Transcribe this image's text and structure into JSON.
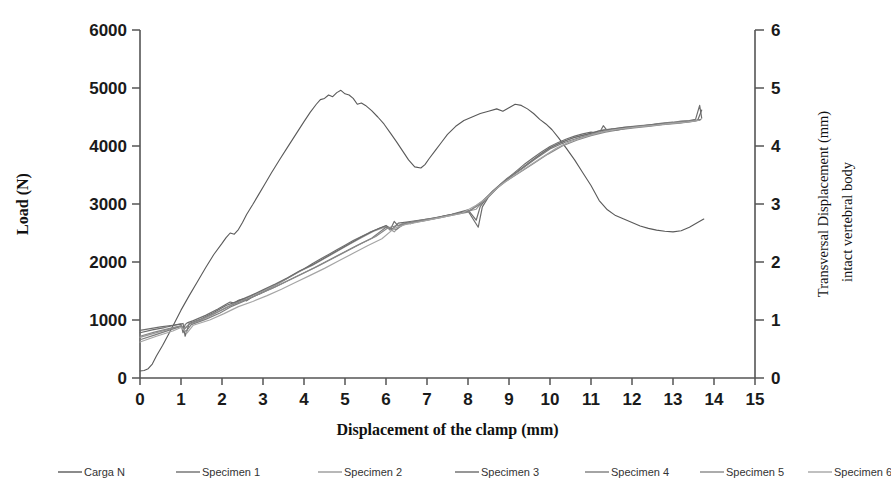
{
  "chart_data": {
    "type": "line",
    "title": "",
    "xlabel": "Displacement of the clamp (mm)",
    "ylabel": "Load (N)",
    "ylabel_right_line1": "Transversal Displacement (mm)",
    "ylabel_right_line2": "intact vertebral body",
    "xlim": [
      0,
      15
    ],
    "ylim": [
      0,
      6000
    ],
    "ylim_right": [
      0,
      6
    ],
    "xticks": [
      "0",
      "1",
      "2",
      "3",
      "4",
      "5",
      "6",
      "7",
      "8",
      "9",
      "10",
      "11",
      "12",
      "13",
      "14",
      "15"
    ],
    "yticks": [
      "0",
      "1000",
      "2000",
      "3000",
      "4000",
      "5000",
      "6000"
    ],
    "yticks_right": [
      "0",
      "1",
      "2",
      "3",
      "4",
      "5",
      "6"
    ],
    "grid": false,
    "legend_position": "bottom",
    "legend": [
      {
        "name": "Carga N",
        "color": "#595959",
        "axis": "left"
      },
      {
        "name": "Specimen 1",
        "color": "#6e6e6e",
        "axis": "right"
      },
      {
        "name": "Specimen 2",
        "color": "#9a9a9a",
        "axis": "right"
      },
      {
        "name": "Specimen 3",
        "color": "#6b6b6b",
        "axis": "right"
      },
      {
        "name": "Specimen 4",
        "color": "#7d7d7d",
        "axis": "right"
      },
      {
        "name": "Specimen 5",
        "color": "#888888",
        "axis": "right"
      },
      {
        "name": "Specimen 6",
        "color": "#a5a5a5",
        "axis": "right"
      }
    ],
    "series": [
      {
        "name": "Carga N",
        "axis": "left",
        "color": "#595959",
        "x": [
          0.0,
          0.1,
          0.2,
          0.3,
          0.4,
          0.55,
          0.7,
          0.85,
          1.0,
          1.2,
          1.4,
          1.6,
          1.8,
          2.0,
          2.1,
          2.2,
          2.3,
          2.4,
          2.5,
          2.6,
          2.75,
          2.9,
          3.05,
          3.2,
          3.4,
          3.6,
          3.8,
          4.0,
          4.15,
          4.3,
          4.4,
          4.5,
          4.6,
          4.7,
          4.8,
          4.9,
          5.0,
          5.1,
          5.2,
          5.3,
          5.4,
          5.5,
          5.65,
          5.8,
          5.95,
          6.1,
          6.25,
          6.4,
          6.55,
          6.7,
          6.85,
          6.95,
          7.05,
          7.2,
          7.35,
          7.5,
          7.7,
          7.9,
          8.1,
          8.3,
          8.5,
          8.7,
          8.85,
          9.0,
          9.15,
          9.3,
          9.45,
          9.6,
          9.75,
          9.9,
          10.05,
          10.2,
          10.4,
          10.6,
          10.8,
          11.0,
          11.2,
          11.4,
          11.6,
          11.8,
          12.0,
          12.2,
          12.4,
          12.6,
          12.8,
          13.0,
          13.2,
          13.4,
          13.6,
          13.75
        ],
        "y": [
          120,
          130,
          160,
          240,
          380,
          560,
          760,
          960,
          1170,
          1420,
          1660,
          1900,
          2130,
          2320,
          2420,
          2500,
          2480,
          2560,
          2680,
          2820,
          2990,
          3170,
          3350,
          3530,
          3760,
          3980,
          4200,
          4420,
          4580,
          4720,
          4800,
          4820,
          4880,
          4850,
          4920,
          4960,
          4900,
          4880,
          4820,
          4720,
          4740,
          4700,
          4610,
          4500,
          4380,
          4230,
          4080,
          3920,
          3760,
          3640,
          3620,
          3680,
          3780,
          3920,
          4060,
          4200,
          4340,
          4440,
          4500,
          4560,
          4600,
          4640,
          4600,
          4660,
          4720,
          4700,
          4640,
          4560,
          4460,
          4380,
          4280,
          4150,
          3960,
          3760,
          3540,
          3320,
          3060,
          2900,
          2800,
          2740,
          2680,
          2620,
          2580,
          2550,
          2530,
          2520,
          2540,
          2600,
          2680,
          2740
        ]
      },
      {
        "name": "Specimen 1",
        "axis": "right",
        "color": "#6e6e6e",
        "x": [
          0.0,
          0.25,
          0.5,
          0.8,
          1.0,
          1.05,
          1.1,
          1.15,
          1.3,
          1.6,
          1.9,
          2.1,
          2.2,
          2.3,
          2.4,
          2.5,
          2.6,
          2.7,
          2.85,
          3.0,
          3.2,
          3.4,
          3.6,
          3.8,
          4.0,
          4.2,
          4.4,
          4.6,
          4.8,
          5.0,
          5.2,
          5.4,
          5.6,
          5.8,
          6.0,
          6.1,
          6.2,
          6.3,
          6.4,
          6.5,
          6.6,
          6.7,
          6.85,
          7.0,
          7.2,
          7.4,
          7.6,
          7.8,
          8.0,
          8.2,
          8.3,
          8.4,
          8.5,
          8.6,
          8.8,
          9.0,
          9.2,
          9.4,
          9.6,
          9.8,
          10.0,
          10.2,
          10.4,
          10.6,
          10.8,
          11.0,
          11.2,
          11.3,
          11.4,
          11.5,
          11.6,
          11.8,
          12.0,
          12.2,
          12.4,
          12.6,
          12.8,
          13.0,
          13.2,
          13.4,
          13.55,
          13.65,
          13.7
        ],
        "y": [
          0.82,
          0.85,
          0.88,
          0.91,
          0.93,
          0.78,
          0.92,
          0.95,
          0.99,
          1.08,
          1.19,
          1.27,
          1.31,
          1.29,
          1.34,
          1.36,
          1.33,
          1.38,
          1.43,
          1.48,
          1.56,
          1.64,
          1.72,
          1.8,
          1.88,
          1.97,
          2.05,
          2.13,
          2.21,
          2.29,
          2.37,
          2.44,
          2.51,
          2.57,
          2.62,
          2.55,
          2.7,
          2.62,
          2.66,
          2.68,
          2.66,
          2.69,
          2.7,
          2.72,
          2.75,
          2.79,
          2.82,
          2.86,
          2.9,
          2.72,
          2.96,
          3.05,
          3.14,
          3.22,
          3.34,
          3.46,
          3.58,
          3.7,
          3.8,
          3.9,
          3.99,
          4.06,
          4.12,
          4.17,
          4.21,
          4.24,
          4.22,
          4.35,
          4.26,
          4.29,
          4.27,
          4.3,
          4.32,
          4.34,
          4.36,
          4.38,
          4.4,
          4.41,
          4.43,
          4.44,
          4.46,
          4.7,
          4.48
        ]
      },
      {
        "name": "Specimen 2",
        "axis": "right",
        "color": "#9a9a9a",
        "x": [
          0.0,
          0.3,
          0.6,
          0.9,
          1.0,
          1.1,
          1.2,
          1.5,
          1.8,
          2.1,
          2.4,
          2.7,
          3.0,
          3.3,
          3.6,
          3.9,
          4.2,
          4.5,
          4.8,
          5.1,
          5.4,
          5.7,
          6.0,
          6.2,
          6.4,
          6.6,
          6.8,
          7.0,
          7.3,
          7.6,
          7.9,
          8.2,
          8.4,
          8.6,
          8.9,
          9.2,
          9.5,
          9.8,
          10.1,
          10.4,
          10.7,
          11.0,
          11.3,
          11.6,
          11.9,
          12.2,
          12.5,
          12.8,
          13.1,
          13.4,
          13.65
        ],
        "y": [
          0.7,
          0.76,
          0.82,
          0.88,
          0.9,
          0.86,
          0.93,
          1.0,
          1.1,
          1.22,
          1.32,
          1.41,
          1.5,
          1.6,
          1.72,
          1.84,
          1.94,
          2.06,
          2.18,
          2.3,
          2.42,
          2.53,
          2.61,
          2.52,
          2.66,
          2.67,
          2.7,
          2.73,
          2.77,
          2.81,
          2.86,
          2.91,
          3.08,
          3.2,
          3.4,
          3.56,
          3.72,
          3.88,
          4.01,
          4.1,
          4.17,
          4.22,
          4.28,
          4.3,
          4.33,
          4.35,
          4.37,
          4.39,
          4.41,
          4.43,
          4.45
        ]
      },
      {
        "name": "Specimen 3",
        "axis": "right",
        "color": "#6b6b6b",
        "x": [
          0.0,
          0.3,
          0.6,
          0.9,
          1.05,
          1.1,
          1.2,
          1.5,
          1.8,
          2.1,
          2.4,
          2.7,
          3.0,
          3.3,
          3.6,
          3.9,
          4.2,
          4.5,
          4.8,
          5.1,
          5.4,
          5.7,
          6.0,
          6.15,
          6.3,
          6.5,
          6.8,
          7.1,
          7.4,
          7.7,
          8.0,
          8.25,
          8.35,
          8.5,
          8.8,
          9.1,
          9.4,
          9.7,
          10.0,
          10.3,
          10.6,
          10.9,
          11.2,
          11.5,
          11.8,
          12.1,
          12.4,
          12.7,
          13.0,
          13.3,
          13.6,
          13.7
        ],
        "y": [
          0.78,
          0.83,
          0.87,
          0.92,
          0.94,
          0.72,
          0.94,
          1.02,
          1.13,
          1.25,
          1.33,
          1.42,
          1.52,
          1.62,
          1.73,
          1.85,
          1.95,
          2.07,
          2.19,
          2.31,
          2.43,
          2.54,
          2.63,
          2.56,
          2.67,
          2.69,
          2.72,
          2.75,
          2.79,
          2.83,
          2.88,
          2.6,
          2.95,
          3.12,
          3.34,
          3.5,
          3.66,
          3.82,
          3.97,
          4.07,
          4.15,
          4.2,
          4.26,
          4.29,
          4.32,
          4.34,
          4.36,
          4.38,
          4.4,
          4.42,
          4.44,
          4.62
        ]
      },
      {
        "name": "Specimen 4",
        "axis": "right",
        "color": "#7d7d7d",
        "x": [
          0.0,
          0.35,
          0.7,
          1.0,
          1.12,
          1.25,
          1.6,
          1.95,
          2.25,
          2.55,
          2.85,
          3.2,
          3.55,
          3.9,
          4.25,
          4.6,
          4.95,
          5.3,
          5.65,
          6.0,
          6.25,
          6.45,
          6.7,
          7.0,
          7.35,
          7.7,
          8.05,
          8.3,
          8.6,
          8.95,
          9.3,
          9.65,
          10.0,
          10.35,
          10.7,
          11.05,
          11.4,
          11.75,
          12.1,
          12.45,
          12.8,
          13.15,
          13.5,
          13.68
        ],
        "y": [
          0.66,
          0.74,
          0.82,
          0.89,
          0.8,
          0.92,
          1.01,
          1.12,
          1.24,
          1.33,
          1.43,
          1.54,
          1.66,
          1.78,
          1.9,
          2.03,
          2.16,
          2.29,
          2.41,
          2.6,
          2.56,
          2.66,
          2.7,
          2.74,
          2.78,
          2.83,
          2.89,
          3.0,
          3.22,
          3.44,
          3.6,
          3.78,
          3.95,
          4.06,
          4.14,
          4.21,
          4.27,
          4.3,
          4.33,
          4.35,
          4.38,
          4.4,
          4.43,
          4.46
        ]
      },
      {
        "name": "Specimen 5",
        "axis": "right",
        "color": "#888888",
        "x": [
          0.0,
          0.35,
          0.7,
          1.0,
          1.08,
          1.2,
          1.55,
          1.9,
          2.25,
          2.6,
          2.95,
          3.3,
          3.65,
          4.0,
          4.35,
          4.7,
          5.05,
          5.4,
          5.75,
          6.05,
          6.35,
          6.65,
          6.95,
          7.3,
          7.65,
          8.0,
          8.3,
          8.55,
          8.9,
          9.25,
          9.6,
          9.95,
          10.3,
          10.65,
          11.0,
          11.35,
          11.7,
          12.05,
          12.4,
          12.75,
          13.1,
          13.45,
          13.66
        ],
        "y": [
          0.72,
          0.79,
          0.85,
          0.9,
          0.84,
          0.93,
          1.03,
          1.14,
          1.26,
          1.36,
          1.46,
          1.57,
          1.69,
          1.81,
          1.93,
          2.06,
          2.19,
          2.32,
          2.44,
          2.59,
          2.64,
          2.68,
          2.72,
          2.76,
          2.81,
          2.86,
          3.02,
          3.18,
          3.38,
          3.54,
          3.7,
          3.86,
          4.0,
          4.1,
          4.18,
          4.24,
          4.28,
          4.31,
          4.34,
          4.37,
          4.39,
          4.42,
          4.45
        ]
      },
      {
        "name": "Specimen 6",
        "axis": "right",
        "color": "#a5a5a5",
        "x": [
          0.0,
          0.4,
          0.8,
          1.0,
          1.15,
          1.3,
          1.7,
          2.05,
          2.4,
          2.75,
          3.1,
          3.45,
          3.8,
          4.15,
          4.5,
          4.85,
          5.2,
          5.55,
          5.9,
          6.2,
          6.5,
          6.8,
          7.15,
          7.5,
          7.85,
          8.2,
          8.45,
          8.75,
          9.1,
          9.45,
          9.8,
          10.15,
          10.5,
          10.85,
          11.2,
          11.55,
          11.9,
          12.25,
          12.6,
          12.95,
          13.3,
          13.62
        ],
        "y": [
          0.62,
          0.72,
          0.81,
          0.87,
          0.78,
          0.91,
          1.0,
          1.11,
          1.23,
          1.32,
          1.42,
          1.53,
          1.65,
          1.77,
          1.89,
          2.02,
          2.15,
          2.28,
          2.4,
          2.58,
          2.65,
          2.69,
          2.74,
          2.79,
          2.84,
          2.98,
          3.1,
          3.3,
          3.48,
          3.64,
          3.8,
          3.96,
          4.08,
          4.16,
          4.23,
          4.28,
          4.31,
          4.34,
          4.36,
          4.39,
          4.41,
          4.44
        ]
      }
    ]
  }
}
